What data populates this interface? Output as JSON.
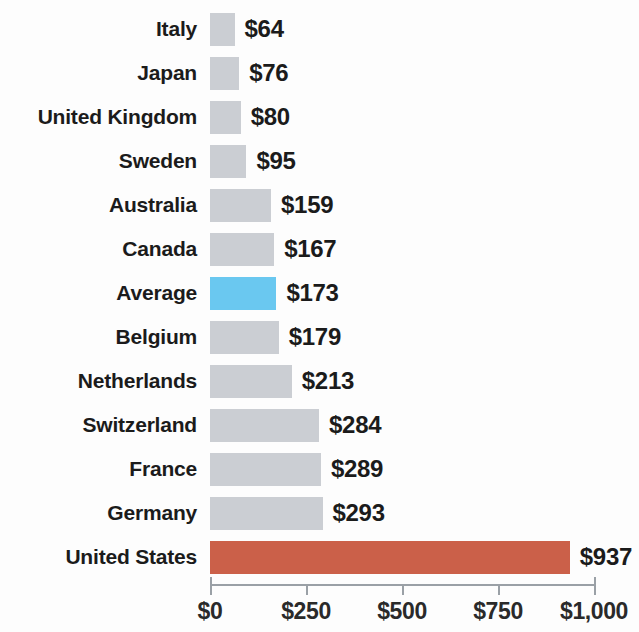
{
  "chart_data": {
    "type": "bar",
    "orientation": "horizontal",
    "title": "",
    "subtitle": "",
    "xlabel": "",
    "ylabel": "",
    "xlim": [
      0,
      1000
    ],
    "grid": false,
    "legend": false,
    "value_prefix": "$",
    "categories": [
      "Italy",
      "Japan",
      "United Kingdom",
      "Sweden",
      "Australia",
      "Canada",
      "Average",
      "Belgium",
      "Netherlands",
      "Switzerland",
      "France",
      "Germany",
      "United States"
    ],
    "values": [
      64,
      76,
      80,
      95,
      159,
      167,
      173,
      179,
      213,
      284,
      289,
      293,
      937
    ],
    "value_labels": [
      "$64",
      "$76",
      "$80",
      "$95",
      "$159",
      "$167",
      "$173",
      "$179",
      "$213",
      "$284",
      "$289",
      "$293",
      "$937"
    ],
    "bar_styles": [
      "default",
      "default",
      "default",
      "default",
      "default",
      "default",
      "highlight",
      "default",
      "default",
      "default",
      "default",
      "default",
      "focus"
    ],
    "tick_values": [
      0,
      250,
      500,
      750,
      1000
    ],
    "tick_labels": [
      "$0",
      "$250",
      "$500",
      "$750",
      "$1,000"
    ],
    "colors": {
      "default": "#cbced3",
      "highlight": "#6ac8f0",
      "focus": "#cb6049",
      "axis": "#9aa0a6",
      "text": "#1b1b1b",
      "background": "#fdfdfd"
    }
  },
  "rows": [
    {
      "category": "Italy",
      "value": 64,
      "label": "$64",
      "style": "default"
    },
    {
      "category": "Japan",
      "value": 76,
      "label": "$76",
      "style": "default"
    },
    {
      "category": "United Kingdom",
      "value": 80,
      "label": "$80",
      "style": "default"
    },
    {
      "category": "Sweden",
      "value": 95,
      "label": "$95",
      "style": "default"
    },
    {
      "category": "Australia",
      "value": 159,
      "label": "$159",
      "style": "default"
    },
    {
      "category": "Canada",
      "value": 167,
      "label": "$167",
      "style": "default"
    },
    {
      "category": "Average",
      "value": 173,
      "label": "$173",
      "style": "highlight"
    },
    {
      "category": "Belgium",
      "value": 179,
      "label": "$179",
      "style": "default"
    },
    {
      "category": "Netherlands",
      "value": 213,
      "label": "$213",
      "style": "default"
    },
    {
      "category": "Switzerland",
      "value": 284,
      "label": "$284",
      "style": "default"
    },
    {
      "category": "France",
      "value": 289,
      "label": "$289",
      "style": "default"
    },
    {
      "category": "Germany",
      "value": 293,
      "label": "$293",
      "style": "default"
    },
    {
      "category": "United States",
      "value": 937,
      "label": "$937",
      "style": "focus"
    }
  ],
  "axis": {
    "ticks": [
      {
        "value": 0,
        "label": "$0"
      },
      {
        "value": 250,
        "label": "$250"
      },
      {
        "value": 500,
        "label": "$500"
      },
      {
        "value": 750,
        "label": "$750"
      },
      {
        "value": 1000,
        "label": "$1,000"
      }
    ]
  }
}
